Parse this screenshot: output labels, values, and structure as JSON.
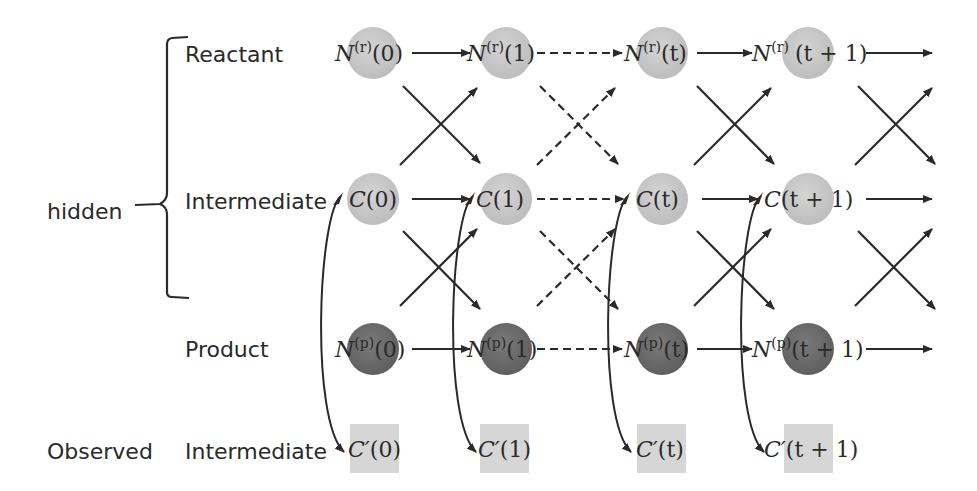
{
  "diagram": {
    "type": "hidden-markov-style chain",
    "group_labels": {
      "hidden": "hidden",
      "observed": "Observed"
    },
    "row_labels": {
      "reactant": "Reactant",
      "intermediate": "Intermediate",
      "product": "Product",
      "observed_intermediate": "Intermediate"
    },
    "timesteps": [
      "0",
      "1",
      "t",
      "t + 1"
    ],
    "reactant_nodes": [
      {
        "base": "N",
        "sup": "(r)",
        "arg": "(0)"
      },
      {
        "base": "N",
        "sup": "(r)",
        "arg": "(1)"
      },
      {
        "base": "N",
        "sup": "(r)",
        "arg": "(t)"
      },
      {
        "base": "N",
        "sup": "(r)",
        "arg": "(t + 1)"
      }
    ],
    "intermediate_nodes": [
      {
        "base": "C",
        "arg": "(0)"
      },
      {
        "base": "C",
        "arg": "(1)"
      },
      {
        "base": "C",
        "arg": "(t)"
      },
      {
        "base": "C",
        "arg": "(t + 1)"
      }
    ],
    "product_nodes": [
      {
        "base": "N",
        "sup": "(p)",
        "arg": "(0)"
      },
      {
        "base": "N",
        "sup": "(p)",
        "arg": "(1)"
      },
      {
        "base": "N",
        "sup": "(p)",
        "arg": "(t)"
      },
      {
        "base": "N",
        "sup": "(p)",
        "arg": "(t + 1)"
      }
    ],
    "observed_nodes": [
      {
        "base": "C′",
        "arg": "(0)"
      },
      {
        "base": "C′",
        "arg": "(1)"
      },
      {
        "base": "C′",
        "arg": "(t)"
      },
      {
        "base": "C′",
        "arg": "(t + 1)"
      }
    ],
    "edge_styles": [
      "solid",
      "dashed",
      "solid",
      "solid"
    ],
    "colors": {
      "reactant_fill": "#c8c8c8",
      "intermediate_fill": "#cfcfcf",
      "product_fill": "#6e6e6e",
      "observed_fill": "#d6d6d6",
      "stroke": "#2a2a2a"
    }
  }
}
